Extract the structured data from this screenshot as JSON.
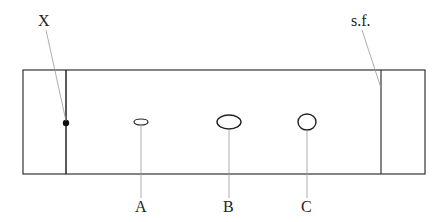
{
  "diagram": {
    "type": "chromatography-plate",
    "labels": {
      "origin": "X",
      "solvent_front": "s.f.",
      "spots": [
        "A",
        "B",
        "C"
      ]
    }
  }
}
